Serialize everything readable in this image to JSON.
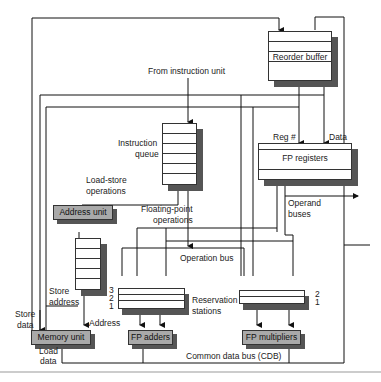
{
  "diagram": {
    "components": {
      "reorder_buffer": "Reorder buffer",
      "fp_registers": "FP registers",
      "instruction_queue": "Instruction\nqueue",
      "address_unit": "Address unit",
      "load_buffers": "Load buffers",
      "memory_unit": "Memory unit",
      "fp_adders": "FP adders",
      "fp_multipliers": "FP multipliers",
      "reservation_stations": "Reservation\nstations"
    },
    "labels": {
      "from_instruction_unit": "From instruction unit",
      "reg_num": "Reg #",
      "data": "Data",
      "load_store_ops_1": "Load-store",
      "load_store_ops_2": "operations",
      "fp_ops_1": "Floating-point",
      "fp_ops_2": "operations",
      "operand_buses_1": "Operand",
      "operand_buses_2": "buses",
      "operation_bus": "Operation bus",
      "store_address_1": "Store",
      "store_address_2": "address",
      "store_data_1": "Store",
      "store_data_2": "data",
      "address": "Address",
      "load_data_1": "Load",
      "load_data_2": "data",
      "cdb": "Common data bus (CDB)",
      "rs_adders_nums": [
        "3",
        "2",
        "1"
      ],
      "rs_mult_nums": [
        "2",
        "1"
      ],
      "reservation_1": "Reservation",
      "reservation_2": "stations",
      "iq_1": "Instruction",
      "iq_2": "queue"
    }
  }
}
